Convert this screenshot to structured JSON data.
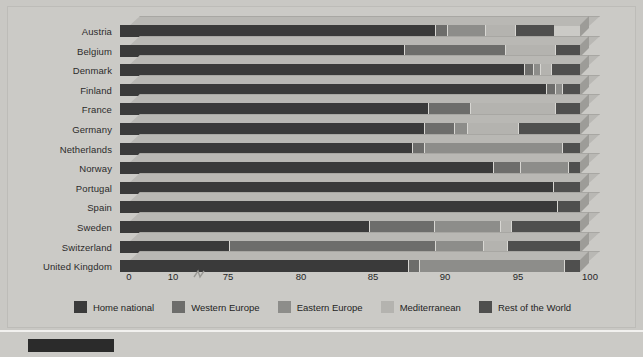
{
  "chart_data": {
    "type": "bar",
    "orientation": "horizontal",
    "stacked": true,
    "title": "",
    "xlabel": "",
    "ylabel": "",
    "xlim": [
      75,
      100
    ],
    "axis_break": true,
    "axis_break_note": "axis broken between 10 and 75",
    "xticks": [
      "0",
      "10",
      "75",
      "80",
      "85",
      "90",
      "95",
      "100"
    ],
    "xtick_values": [
      0,
      10,
      75,
      80,
      85,
      90,
      95,
      100
    ],
    "grid": false,
    "legend_position": "bottom",
    "categories": [
      "Austria",
      "Belgium",
      "Denmark",
      "Finland",
      "France",
      "Germany",
      "Netherlands",
      "Norway",
      "Portugal",
      "Spain",
      "Sweden",
      "Switzerland",
      "United Kingdom"
    ],
    "series": [
      {
        "name": "Home national",
        "color": "#3a3a3a",
        "values": [
          92.2,
          90.5,
          97.0,
          98.2,
          91.8,
          91.6,
          90.9,
          95.3,
          98.6,
          98.8,
          88.6,
          81.0,
          90.7
        ]
      },
      {
        "name": "Western Europe",
        "color": "#6d6d6b",
        "values": [
          0.6,
          5.5,
          0.5,
          0.5,
          2.3,
          1.6,
          0.7,
          1.5,
          0.0,
          0.0,
          3.5,
          11.2,
          0.6
        ]
      },
      {
        "name": "Eastern Europe",
        "color": "#8d8d8a",
        "values": [
          2.1,
          0.0,
          0.4,
          0.4,
          0.0,
          0.7,
          7.5,
          2.6,
          0.0,
          0.0,
          3.6,
          2.6,
          7.9
        ]
      },
      {
        "name": "Mediterranean",
        "color": "#b4b3af",
        "values": [
          1.6,
          2.7,
          0.6,
          0.0,
          4.6,
          2.8,
          0.0,
          0.0,
          0.0,
          0.0,
          0.6,
          1.3,
          0.0
        ]
      },
      {
        "name": "Rest of the World",
        "color": "#4f4f4e",
        "values": [
          2.1,
          1.3,
          1.5,
          0.9,
          1.3,
          3.3,
          0.9,
          0.6,
          1.4,
          1.2,
          3.7,
          3.9,
          0.8
        ]
      }
    ]
  },
  "legend": {
    "items": [
      {
        "label": "Home national",
        "color": "#3a3a3a"
      },
      {
        "label": "Western Europe",
        "color": "#6d6d6b"
      },
      {
        "label": "Eastern Europe",
        "color": "#8d8d8a"
      },
      {
        "label": "Mediterranean",
        "color": "#b4b3af"
      },
      {
        "label": "Rest of the World",
        "color": "#4f4f4e"
      }
    ]
  },
  "colors": {
    "background": "#c9c8c4",
    "panel": "#cbcac6",
    "top_face": "#b9b8b4",
    "side_face": "#9d9c98",
    "text": "#262626",
    "chip": "#2b2b2b"
  }
}
